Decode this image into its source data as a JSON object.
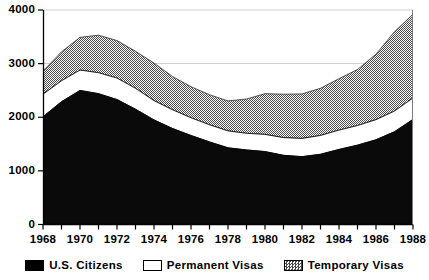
{
  "chart_data": {
    "type": "area",
    "stacked": true,
    "title": "",
    "subtitle": "",
    "xlabel": "",
    "ylabel": "",
    "xlim": [
      1968,
      1988
    ],
    "ylim": [
      0,
      4000
    ],
    "yticks": [
      0,
      1000,
      2000,
      3000,
      4000
    ],
    "ytick_labels": [
      "0",
      "1000",
      "2000",
      "3000",
      "4000"
    ],
    "x": [
      1968,
      1969,
      1970,
      1971,
      1972,
      1973,
      1974,
      1975,
      1976,
      1977,
      1978,
      1979,
      1980,
      1981,
      1982,
      1983,
      1984,
      1985,
      1986,
      1987,
      1988
    ],
    "xtick_labels": [
      "1968",
      "",
      "1970",
      "",
      "1972",
      "",
      "1974",
      "",
      "1976",
      "",
      "1978",
      "",
      "1980",
      "",
      "1982",
      "",
      "1984",
      "",
      "1986",
      "",
      "1988"
    ],
    "xtick_minor_every": 1,
    "xtick_label_every": 2,
    "grid": true,
    "gridlines_y": [
      3000,
      4000
    ],
    "legend_position": "bottom",
    "series": [
      {
        "name": "U.S. Citizens",
        "color": "#000000",
        "fill": "solid-black",
        "values": [
          2010,
          2290,
          2500,
          2440,
          2330,
          2150,
          1950,
          1790,
          1660,
          1540,
          1430,
          1390,
          1360,
          1290,
          1265,
          1310,
          1400,
          1480,
          1580,
          1730,
          1960
        ]
      },
      {
        "name": "Permanent Visas",
        "color": "#ffffff",
        "fill": "white",
        "values": [
          420,
          390,
          380,
          390,
          400,
          390,
          360,
          350,
          330,
          320,
          315,
          310,
          320,
          330,
          340,
          350,
          360,
          365,
          375,
          385,
          400
        ]
      },
      {
        "name": "Temporary Visas",
        "color": "#9a9a9a",
        "fill": "gray-hatch",
        "values": [
          430,
          540,
          610,
          700,
          700,
          690,
          700,
          620,
          580,
          560,
          560,
          640,
          760,
          810,
          830,
          880,
          960,
          1045,
          1220,
          1480,
          1560
        ]
      }
    ],
    "totals": [
      2860,
      3220,
      3490,
      3530,
      3430,
      3230,
      3010,
      2760,
      2570,
      2420,
      2305,
      2340,
      2440,
      2430,
      2435,
      2540,
      2720,
      2890,
      3175,
      3595,
      3920
    ]
  },
  "legend": {
    "items": [
      {
        "label": "U.S. Citizens",
        "swatch": "solid-black"
      },
      {
        "label": "Permanent Visas",
        "swatch": "white"
      },
      {
        "label": "Temporary Visas",
        "swatch": "gray-hatch"
      }
    ]
  },
  "colors": {
    "citizens": "#000000",
    "permanent": "#ffffff",
    "temporary": "#9a9a9a",
    "axis": "#000000",
    "grid": "#cfcfcf",
    "background": "#ffffff"
  }
}
